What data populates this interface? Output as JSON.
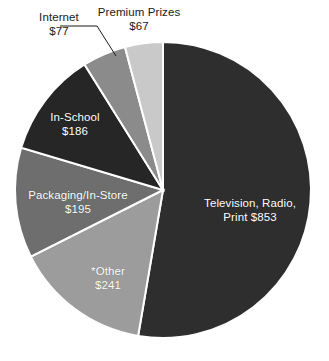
{
  "chart_data": {
    "type": "pie",
    "title": "",
    "subtitle": "",
    "xlabel": "",
    "ylabel": "",
    "legend_position": "none",
    "grid": false,
    "units": "$ millions",
    "total": 1619,
    "start_angle_deg": 0,
    "direction": "clockwise",
    "categories": [
      "Television, Radio, Print",
      "*Other",
      "Packaging/In-Store",
      "In-School",
      "Internet",
      "Premium Prizes"
    ],
    "values": [
      853,
      241,
      195,
      186,
      77,
      67
    ],
    "colors": [
      "#2e2e2e",
      "#9c9c9c",
      "#6e6e6e",
      "#262626",
      "#8b8b8b",
      "#c9c9c9"
    ],
    "slices": [
      {
        "name": "Television, Radio, Print",
        "value": 853,
        "label_line1": "Television, Radio,",
        "label_line2": "Print $853",
        "value_text": "$853",
        "color": "#2e2e2e",
        "label_placement": "inside",
        "label_color": "#ffffff"
      },
      {
        "name": "*Other",
        "value": 241,
        "label_line1": "*Other",
        "label_line2": "$241",
        "value_text": "$241",
        "color": "#9c9c9c",
        "label_placement": "inside",
        "label_color": "#ffffff"
      },
      {
        "name": "Packaging/In-Store",
        "value": 195,
        "label_line1": "Packaging/In-Store",
        "label_line2": "$195",
        "value_text": "$195",
        "color": "#6e6e6e",
        "label_placement": "inside",
        "label_color": "#ffffff"
      },
      {
        "name": "In-School",
        "value": 186,
        "label_line1": "In-School",
        "label_line2": "$186",
        "value_text": "$186",
        "color": "#262626",
        "label_placement": "inside",
        "label_color": "#ffffff"
      },
      {
        "name": "Internet",
        "value": 77,
        "label_line1": "Internet",
        "label_line2": "$77",
        "value_text": "$77",
        "color": "#8b8b8b",
        "label_placement": "outside-leader",
        "label_color": "#1a1a1a"
      },
      {
        "name": "Premium Prizes",
        "value": 67,
        "label_line1": "Premium Prizes",
        "label_line2": "$67",
        "value_text": "$67",
        "color": "#c9c9c9",
        "label_placement": "outside",
        "label_color": "#1a1a1a"
      }
    ]
  },
  "labels": {
    "internet": {
      "name": "Internet",
      "value": "$77"
    },
    "premium_prizes": {
      "name": "Premium Prizes",
      "value": "$67"
    },
    "television": {
      "line1": "Television, Radio,",
      "line2": "Print $853"
    },
    "other": {
      "name": "*Other",
      "value": "$241"
    },
    "packaging": {
      "name": "Packaging/In-Store",
      "value": "$195"
    },
    "in_school": {
      "name": "In-School",
      "value": "$186"
    }
  }
}
